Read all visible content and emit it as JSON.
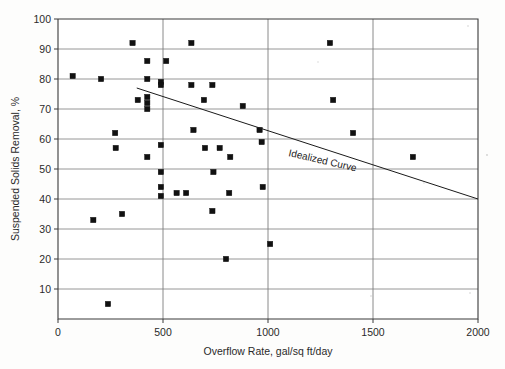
{
  "chart_data": {
    "type": "scatter",
    "title": "",
    "xlabel": "Overflow Rate, gal/sq ft/day",
    "ylabel": "Suspended Solids Removal, %",
    "xlim": [
      0,
      2000
    ],
    "ylim": [
      0,
      100
    ],
    "grid": true,
    "legend_position": "none",
    "xticks": [
      0,
      500,
      1000,
      1500,
      2000
    ],
    "xtick_labels": [
      "0",
      "500",
      "1000",
      "1500",
      "2000"
    ],
    "yticks": [
      10,
      20,
      30,
      40,
      50,
      60,
      70,
      80,
      90,
      100
    ],
    "ytick_labels": [
      "10",
      "20",
      "30",
      "40",
      "50",
      "60",
      "70",
      "80",
      "90",
      "100"
    ],
    "series": [
      {
        "name": "Observed data",
        "marker": "square",
        "color": "#111111",
        "points": [
          [
            70,
            81
          ],
          [
            168,
            33
          ],
          [
            205,
            80
          ],
          [
            238,
            5
          ],
          [
            272,
            62
          ],
          [
            275,
            57
          ],
          [
            305,
            35
          ],
          [
            355,
            92
          ],
          [
            380,
            73
          ],
          [
            425,
            86
          ],
          [
            425,
            80
          ],
          [
            425,
            74
          ],
          [
            425,
            72
          ],
          [
            425,
            70
          ],
          [
            425,
            54
          ],
          [
            490,
            79
          ],
          [
            490,
            78
          ],
          [
            490,
            58
          ],
          [
            490,
            49
          ],
          [
            490,
            44
          ],
          [
            490,
            41
          ],
          [
            515,
            86
          ],
          [
            565,
            42
          ],
          [
            610,
            42
          ],
          [
            635,
            92
          ],
          [
            635,
            78
          ],
          [
            645,
            63
          ],
          [
            695,
            73
          ],
          [
            700,
            57
          ],
          [
            735,
            78
          ],
          [
            735,
            36
          ],
          [
            740,
            49
          ],
          [
            770,
            57
          ],
          [
            800,
            20
          ],
          [
            815,
            42
          ],
          [
            820,
            54
          ],
          [
            880,
            71
          ],
          [
            960,
            63
          ],
          [
            970,
            59
          ],
          [
            975,
            44
          ],
          [
            1010,
            25
          ],
          [
            1295,
            92
          ],
          [
            1310,
            73
          ],
          [
            1405,
            62
          ],
          [
            1690,
            54
          ]
        ]
      }
    ],
    "annotations": [
      {
        "name": "idealized-curve",
        "label": "Idealized Curve",
        "type": "line",
        "from": [
          375,
          77
        ],
        "to": [
          2000,
          40
        ]
      }
    ]
  },
  "axes": {
    "y_title": "Suspended Solids Removal, %",
    "x_title": "Overflow Rate, gal/sq ft/day",
    "curve_label": "Idealized Curve"
  }
}
